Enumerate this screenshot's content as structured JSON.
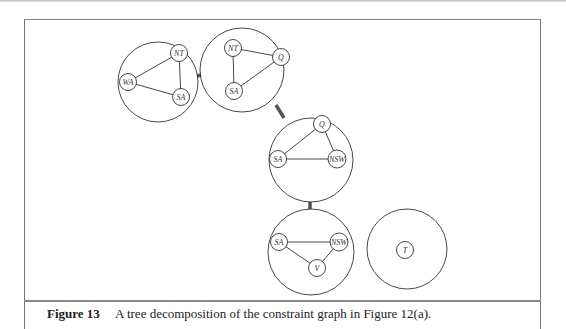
{
  "figure": {
    "caption_label": "Figure 13",
    "caption_text": "A tree decomposition of the constraint graph in Figure 12(a)."
  },
  "diagram": {
    "clusters": [
      {
        "id": "c1",
        "cx": 158,
        "cy": 82,
        "r": 40,
        "nodes": [
          {
            "label": "WA",
            "x": 128,
            "y": 82
          },
          {
            "label": "NT",
            "x": 179,
            "y": 53
          },
          {
            "label": "SA",
            "x": 181,
            "y": 97
          }
        ],
        "edges": [
          [
            "WA",
            "NT"
          ],
          [
            "WA",
            "SA"
          ],
          [
            "NT",
            "SA"
          ]
        ]
      },
      {
        "id": "c2",
        "cx": 242,
        "cy": 70,
        "r": 42,
        "nodes": [
          {
            "label": "NT",
            "x": 233,
            "y": 48
          },
          {
            "label": "Q",
            "x": 281,
            "y": 57
          },
          {
            "label": "SA",
            "x": 234,
            "y": 91
          }
        ],
        "edges": [
          [
            "NT",
            "Q"
          ],
          [
            "NT",
            "SA"
          ],
          [
            "SA",
            "Q"
          ]
        ]
      },
      {
        "id": "c3",
        "cx": 311,
        "cy": 160,
        "r": 42,
        "nodes": [
          {
            "label": "Q",
            "x": 322,
            "y": 124
          },
          {
            "label": "SA",
            "x": 278,
            "y": 159
          },
          {
            "label": "NSW",
            "x": 337,
            "y": 159
          }
        ],
        "edges": [
          [
            "SA",
            "Q"
          ],
          [
            "Q",
            "NSW"
          ],
          [
            "SA",
            "NSW"
          ]
        ]
      },
      {
        "id": "c4",
        "cx": 311,
        "cy": 252,
        "r": 43,
        "nodes": [
          {
            "label": "SA",
            "x": 279,
            "y": 242
          },
          {
            "label": "NSW",
            "x": 339,
            "y": 242
          },
          {
            "label": "V",
            "x": 317,
            "y": 268
          }
        ],
        "edges": [
          [
            "SA",
            "NSW"
          ],
          [
            "SA",
            "V"
          ],
          [
            "NSW",
            "V"
          ]
        ]
      },
      {
        "id": "c5",
        "cx": 407,
        "cy": 249,
        "r": 40,
        "nodes": [
          {
            "label": "T",
            "x": 405,
            "y": 250
          }
        ],
        "edges": []
      }
    ],
    "tree_edges": [
      {
        "x1": 197,
        "y1": 76,
        "x2": 201,
        "y2": 75
      },
      {
        "x1": 276,
        "y1": 105,
        "x2": 284,
        "y2": 118
      },
      {
        "x1": 310,
        "y1": 202,
        "x2": 310,
        "y2": 209
      }
    ]
  }
}
